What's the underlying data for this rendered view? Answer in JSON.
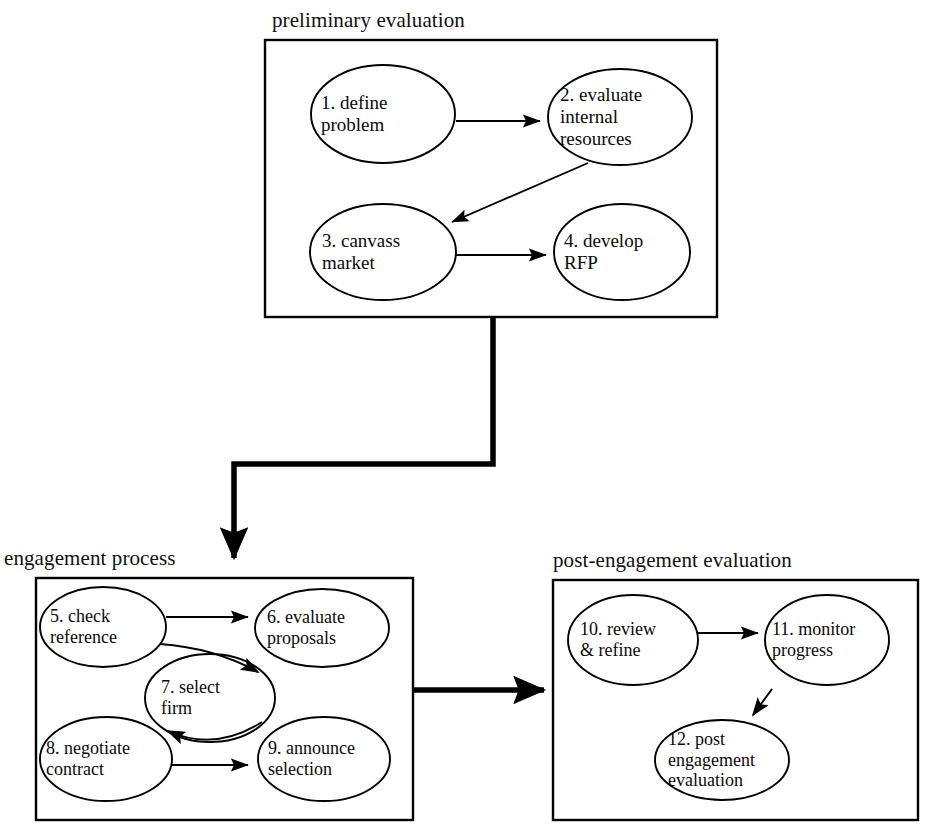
{
  "diagram": {
    "background_color": "#ffffff",
    "line_color": "#000000",
    "groups": [
      {
        "id": "preliminary-evaluation",
        "label": "preliminary evaluation",
        "label_x": 272,
        "label_y": 10,
        "box": {
          "x": 265,
          "y": 40,
          "w": 452,
          "h": 277
        },
        "border_width": 2.2
      },
      {
        "id": "engagement-process",
        "label": "engagement process",
        "label_x": 4,
        "label_y": 548,
        "box": {
          "x": 36,
          "y": 578,
          "w": 377,
          "h": 242
        },
        "border_width": 2.2
      },
      {
        "id": "post-engagement-evaluation",
        "label": "post-engagement  evaluation",
        "label_x": 553,
        "label_y": 550,
        "box": {
          "x": 553,
          "y": 580,
          "w": 365,
          "h": 240
        },
        "border_width": 2.2
      }
    ],
    "nodes": [
      {
        "id": "n1",
        "number": "1.",
        "lines": [
          "1.  define",
          "problem"
        ],
        "cx": 383,
        "cy": 114,
        "rx": 72,
        "ry": 49,
        "label_x": 321,
        "label_y": 114,
        "align": "left"
      },
      {
        "id": "n2",
        "number": "2.",
        "lines": [
          "2.  evaluate",
          "internal",
          "resources"
        ],
        "cx": 620,
        "cy": 117,
        "rx": 72,
        "ry": 48,
        "label_x": 560,
        "label_y": 117,
        "align": "left"
      },
      {
        "id": "n3",
        "number": "3.",
        "lines": [
          "3.  canvass",
          "market"
        ],
        "cx": 383,
        "cy": 252,
        "rx": 73,
        "ry": 48,
        "label_x": 322,
        "label_y": 252,
        "align": "left"
      },
      {
        "id": "n4",
        "number": "4.",
        "lines": [
          "4.  develop",
          "RFP"
        ],
        "cx": 622,
        "cy": 252,
        "rx": 68,
        "ry": 48,
        "label_x": 564,
        "label_y": 252,
        "align": "left"
      },
      {
        "id": "n5",
        "number": "5.",
        "lines": [
          "5.  check",
          "reference"
        ],
        "cx": 103,
        "cy": 627,
        "rx": 63,
        "ry": 40,
        "label_x": 50,
        "label_y": 627,
        "align": "left"
      },
      {
        "id": "n6",
        "number": "6.",
        "lines": [
          "6.  evaluate",
          "proposals"
        ],
        "cx": 322,
        "cy": 628,
        "rx": 67,
        "ry": 39,
        "label_x": 267,
        "label_y": 628,
        "align": "left"
      },
      {
        "id": "n7",
        "number": "7.",
        "lines": [
          "7.  select",
          "firm"
        ],
        "cx": 210,
        "cy": 698,
        "rx": 65,
        "ry": 44,
        "label_x": 161,
        "label_y": 698,
        "align": "left"
      },
      {
        "id": "n8",
        "number": "8.",
        "lines": [
          "8.  negotiate",
          "contract"
        ],
        "cx": 106,
        "cy": 759,
        "rx": 66,
        "ry": 42,
        "label_x": 46,
        "label_y": 759,
        "align": "left"
      },
      {
        "id": "n9",
        "number": "9.",
        "lines": [
          "9.  announce",
          "selection"
        ],
        "cx": 324,
        "cy": 759,
        "rx": 66,
        "ry": 42,
        "label_x": 268,
        "label_y": 759,
        "align": "left"
      },
      {
        "id": "n10",
        "number": "10.",
        "lines": [
          "10.  review",
          "&  refine"
        ],
        "cx": 633,
        "cy": 640,
        "rx": 65,
        "ry": 45,
        "label_x": 580,
        "label_y": 640,
        "align": "left"
      },
      {
        "id": "n11",
        "number": "11.",
        "lines": [
          "11.  monitor",
          "progress"
        ],
        "cx": 827,
        "cy": 640,
        "rx": 62,
        "ry": 45,
        "label_x": 772,
        "label_y": 640,
        "align": "left"
      },
      {
        "id": "n12",
        "number": "12.",
        "lines": [
          "12.  post",
          "engagement",
          "evaluation"
        ],
        "cx": 722,
        "cy": 760,
        "rx": 67,
        "ry": 40,
        "label_x": 668,
        "label_y": 760,
        "align": "left"
      }
    ],
    "edges": [
      {
        "id": "e1-2",
        "from": "n1",
        "to": "n2",
        "kind": "straight"
      },
      {
        "id": "e2-3",
        "from": "n2",
        "to": "n3",
        "kind": "diagonal"
      },
      {
        "id": "e3-4",
        "from": "n3",
        "to": "n4",
        "kind": "straight"
      },
      {
        "id": "e5-6",
        "from": "n5",
        "to": "n6",
        "kind": "straight"
      },
      {
        "id": "e6-7",
        "from": "n6",
        "to": "n7",
        "kind": "curved"
      },
      {
        "id": "e7-8",
        "from": "n7",
        "to": "n8",
        "kind": "curved"
      },
      {
        "id": "e8-9",
        "from": "n8",
        "to": "n9",
        "kind": "straight"
      },
      {
        "id": "e10-11",
        "from": "n10",
        "to": "n11",
        "kind": "straight"
      },
      {
        "id": "e11-12",
        "from": "n11",
        "to": "n12",
        "kind": "diagonal"
      }
    ],
    "connectors": [
      {
        "id": "c-prelim-to-engagement",
        "kind": "elbow-thick",
        "from_group": "preliminary-evaluation",
        "to_group": "engagement-process"
      },
      {
        "id": "c-engagement-to-post",
        "kind": "arrow-thick",
        "from_group": "engagement-process",
        "to_group": "post-engagement-evaluation"
      }
    ]
  }
}
